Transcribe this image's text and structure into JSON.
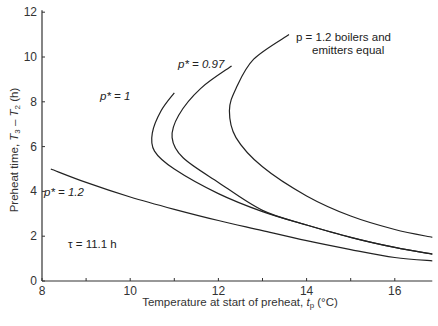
{
  "chart_data": {
    "type": "line",
    "title": "",
    "xlabel": "Temperature at start of preheat, t_p (°C)",
    "ylabel": "Preheat time, T3 − T2 (h)",
    "xlim": [
      8,
      16.85
    ],
    "ylim": [
      0,
      12
    ],
    "xticks": [
      8,
      10,
      12,
      14,
      16
    ],
    "xminor": [
      9,
      11,
      13,
      15
    ],
    "yticks": [
      0,
      2,
      4,
      6,
      8,
      10,
      12
    ],
    "grid": false,
    "legend": "inline annotations",
    "series": [
      {
        "name": "p* = 1.2",
        "points": [
          [
            8.2,
            5.0
          ],
          [
            9,
            4.4
          ],
          [
            10,
            3.75
          ],
          [
            11,
            3.2
          ],
          [
            12,
            2.7
          ],
          [
            13,
            2.25
          ],
          [
            14,
            1.8
          ],
          [
            15,
            1.4
          ],
          [
            16,
            1.05
          ],
          [
            16.85,
            0.9
          ]
        ]
      },
      {
        "name": "p* = 1",
        "points": [
          [
            11.0,
            8.4
          ],
          [
            10.7,
            7.6
          ],
          [
            10.5,
            6.6
          ],
          [
            10.55,
            5.8
          ],
          [
            11,
            5.0
          ],
          [
            12,
            3.9
          ],
          [
            13,
            3.1
          ],
          [
            14,
            2.5
          ],
          [
            15,
            1.95
          ],
          [
            16,
            1.5
          ],
          [
            16.85,
            1.2
          ]
        ]
      },
      {
        "name": "p* = 0.97",
        "points": [
          [
            12.3,
            9.6
          ],
          [
            11.6,
            8.6
          ],
          [
            11.1,
            7.4
          ],
          [
            10.95,
            6.4
          ],
          [
            11.2,
            5.5
          ],
          [
            12,
            4.4
          ],
          [
            13,
            3.15
          ],
          [
            14,
            2.5
          ],
          [
            15,
            1.95
          ],
          [
            16,
            1.5
          ],
          [
            16.85,
            1.2
          ]
        ]
      },
      {
        "name": "p = 1.2 boilers and emitters equal",
        "points": [
          [
            13.6,
            11.0
          ],
          [
            12.8,
            9.9
          ],
          [
            12.4,
            8.6
          ],
          [
            12.25,
            7.6
          ],
          [
            12.4,
            6.4
          ],
          [
            13,
            5.1
          ],
          [
            14,
            3.8
          ],
          [
            15,
            2.9
          ],
          [
            16,
            2.3
          ],
          [
            16.85,
            1.95
          ]
        ]
      }
    ],
    "annotations": [
      {
        "text": "p* = 1.2",
        "x": 8.3,
        "y": 4.0
      },
      {
        "text": "p* = 1",
        "x": 9.8,
        "y": 8.1
      },
      {
        "text": "p* = 0.97",
        "x": 11.1,
        "y": 9.6
      },
      {
        "text": "p = 1.2 boilers and emitters equal",
        "x": 13.8,
        "y": 11.0
      },
      {
        "text": "τ = 11.1 h",
        "x": 8.9,
        "y": 1.5
      }
    ]
  },
  "labels": {
    "x_title_main": "Temperature at start of preheat, ",
    "x_title_var": "t",
    "x_title_sub": "p",
    "x_title_unit": " (°C)",
    "y_title_main": "Preheat time, ",
    "y_title_v1": "T",
    "y_title_s1": "3",
    "y_title_mid": " – ",
    "y_title_v2": "T",
    "y_title_s2": "2",
    "y_title_unit": " (h)",
    "ann_p12": "p* = 1.2",
    "ann_p1": "p* = 1",
    "ann_p097": "p* = 0.97",
    "ann_equal_l1": "p = 1.2 boilers and",
    "ann_equal_l2": "emitters equal",
    "ann_tau": "τ = 11.1 h"
  },
  "colors": {
    "line": "#222222",
    "axis": "#333333",
    "background": "#ffffff"
  }
}
